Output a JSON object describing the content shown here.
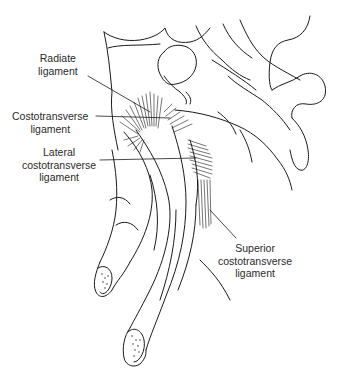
{
  "figure": {
    "labels": {
      "radiate": {
        "line1": "Radiate",
        "line2": "ligament"
      },
      "costotransverse": {
        "line1": "Costotransverse",
        "line2": "ligament"
      },
      "lateral": {
        "line1": "Lateral",
        "line2": "costotransverse",
        "line3": "ligament"
      },
      "superior": {
        "line1": "Superior",
        "line2": "costotransverse",
        "line3": "ligament"
      }
    },
    "colors": {
      "ink": "#1a1a1a",
      "text": "#2a2a2a",
      "background": "#ffffff"
    }
  }
}
